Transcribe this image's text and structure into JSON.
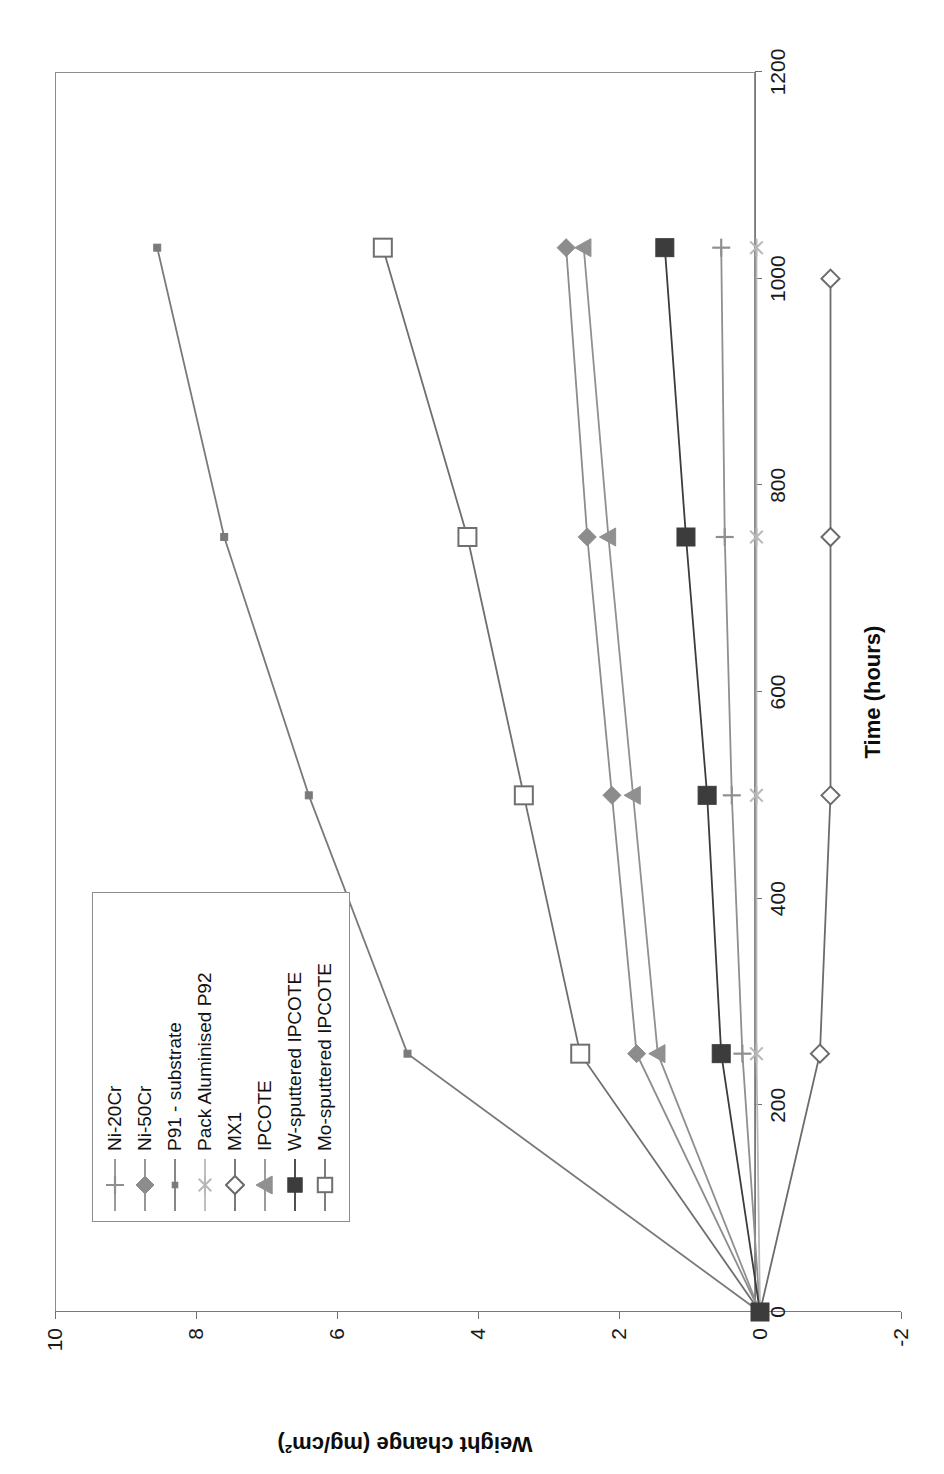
{
  "chart_data": {
    "type": "line",
    "title": "",
    "xlabel": "Time (hours)",
    "ylabel": "Weight change (mg/cm²)",
    "xlim": [
      0,
      1200
    ],
    "ylim": [
      -2,
      10
    ],
    "xticks": [
      0,
      200,
      400,
      600,
      800,
      1000,
      1200
    ],
    "yticks": [
      -2,
      0,
      2,
      4,
      6,
      8,
      10
    ],
    "grid": false,
    "orientation": "rotated-90-ccw",
    "legend_position": "inside-lower-left",
    "series": [
      {
        "name": "Ni-20Cr",
        "marker": "plus",
        "color": "#8f8f8f",
        "x": [
          0,
          250,
          500,
          750,
          1030
        ],
        "y": [
          0,
          0.25,
          0.4,
          0.5,
          0.55
        ]
      },
      {
        "name": "Ni-50Cr",
        "marker": "diamond-filled",
        "color": "#8c8c8c",
        "x": [
          0,
          250,
          500,
          750,
          1030
        ],
        "y": [
          0,
          1.75,
          2.1,
          2.45,
          2.75
        ]
      },
      {
        "name": "P91 - substrate",
        "marker": "square-small",
        "color": "#7a7a7a",
        "x": [
          0,
          250,
          500,
          750,
          1030
        ],
        "y": [
          0,
          5.0,
          6.4,
          7.6,
          8.55
        ]
      },
      {
        "name": "Pack Aluminised P92",
        "marker": "asterisk",
        "color": "#b8b8b8",
        "x": [
          0,
          250,
          500,
          750,
          1030
        ],
        "y": [
          0,
          0.05,
          0.05,
          0.05,
          0.05
        ]
      },
      {
        "name": "MX1",
        "marker": "diamond-open",
        "color": "#6b6b6b",
        "x": [
          0,
          250,
          500,
          750,
          1000
        ],
        "y": [
          0,
          -0.85,
          -1.0,
          -1.0,
          -1.0
        ]
      },
      {
        "name": "IPCOTE",
        "marker": "triangle-filled",
        "color": "#909090",
        "x": [
          0,
          250,
          500,
          750,
          1030
        ],
        "y": [
          0,
          1.45,
          1.8,
          2.15,
          2.5
        ]
      },
      {
        "name": "W-sputtered IPCOTE",
        "marker": "square-filled",
        "color": "#3c3c3c",
        "x": [
          0,
          250,
          500,
          750,
          1030
        ],
        "y": [
          0,
          0.55,
          0.75,
          1.05,
          1.35
        ]
      },
      {
        "name": "Mo-sputtered IPCOTE",
        "marker": "square-open",
        "color": "#6f6f6f",
        "x": [
          0,
          250,
          500,
          750,
          1030
        ],
        "y": [
          0,
          2.55,
          3.35,
          4.15,
          5.35
        ]
      }
    ]
  },
  "axes": {
    "x_title": "Time (hours)",
    "y_title": "Weight change (mg/cm²)",
    "x_tick_labels": [
      "0",
      "200",
      "400",
      "600",
      "800",
      "1000",
      "1200"
    ],
    "y_tick_labels": [
      "10",
      "8",
      "6",
      "4",
      "2",
      "0",
      "-2"
    ]
  },
  "legend": {
    "items": [
      {
        "label": "Ni-20Cr",
        "marker": "plus-icon",
        "color": "#8f8f8f"
      },
      {
        "label": "Ni-50Cr",
        "marker": "diamond-filled-icon",
        "color": "#8c8c8c"
      },
      {
        "label": "P91 - substrate",
        "marker": "square-small-icon",
        "color": "#7a7a7a"
      },
      {
        "label": "Pack Aluminised P92",
        "marker": "asterisk-icon",
        "color": "#b8b8b8"
      },
      {
        "label": "MX1",
        "marker": "diamond-open-icon",
        "color": "#6b6b6b"
      },
      {
        "label": "IPCOTE",
        "marker": "triangle-filled-icon",
        "color": "#909090"
      },
      {
        "label": "W-sputtered IPCOTE",
        "marker": "square-filled-icon",
        "color": "#3c3c3c"
      },
      {
        "label": "Mo-sputtered IPCOTE",
        "marker": "square-open-icon",
        "color": "#6f6f6f"
      }
    ]
  },
  "colors": {
    "axis": "#7a7a7a",
    "frame": "#8d8d8d",
    "text": "#111111",
    "background": "#ffffff"
  }
}
